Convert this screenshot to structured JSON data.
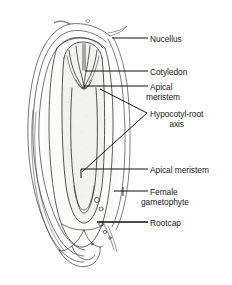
{
  "figure": {
    "width": 232,
    "height": 285,
    "background_color": "#ffffff",
    "line_color": "#1a1a1a",
    "shading_color": "#d8d8d4",
    "text_color": "#1a1a1a"
  },
  "labels": [
    {
      "id": "nucellus",
      "name": "nucellus-label",
      "text": "Nucellus",
      "lines": [
        "Nucellus"
      ],
      "x": 150,
      "y": 34
    },
    {
      "id": "cotyledon",
      "name": "cotyledon-label",
      "text": "Cotyledon",
      "lines": [
        "Cotyledon"
      ],
      "x": 150,
      "y": 67
    },
    {
      "id": "apical_meristem_top",
      "name": "apical-meristem-upper-label",
      "text": "Apical meristem",
      "lines": [
        "Apical",
        "meristem"
      ],
      "x": 150,
      "y": 82
    },
    {
      "id": "hypocotyl_root_axis",
      "name": "hypocotyl-root-axis-label",
      "text": "Hypocotyl-root axis",
      "lines": [
        "Hypocotyl-root",
        "axis"
      ],
      "x": 150,
      "y": 109
    },
    {
      "id": "apical_meristem_bottom",
      "name": "apical-meristem-lower-label",
      "text": "Apical meristem",
      "lines": [
        "Apical meristem"
      ],
      "x": 150,
      "y": 165
    },
    {
      "id": "female_gametophyte",
      "name": "female-gametophyte-label",
      "text": "Female gametophyte",
      "lines": [
        "Female",
        "gametophyte"
      ],
      "x": 150,
      "y": 187
    },
    {
      "id": "rootcap",
      "name": "rootcap-label",
      "text": "Rootcap",
      "lines": [
        "Rootcap"
      ],
      "x": 150,
      "y": 218
    }
  ],
  "label_text": {
    "nucellus": "Nucellus",
    "cotyledon": "Cotyledon",
    "apical_top_line1": "Apical",
    "apical_top_line2": "meristem",
    "hypocotyl_line1": "Hypocotyl-root",
    "hypocotyl_line2": "axis",
    "apical_bottom": "Apical meristem",
    "female_line1": "Female",
    "female_line2": "gametophyte",
    "rootcap": "Rootcap"
  }
}
